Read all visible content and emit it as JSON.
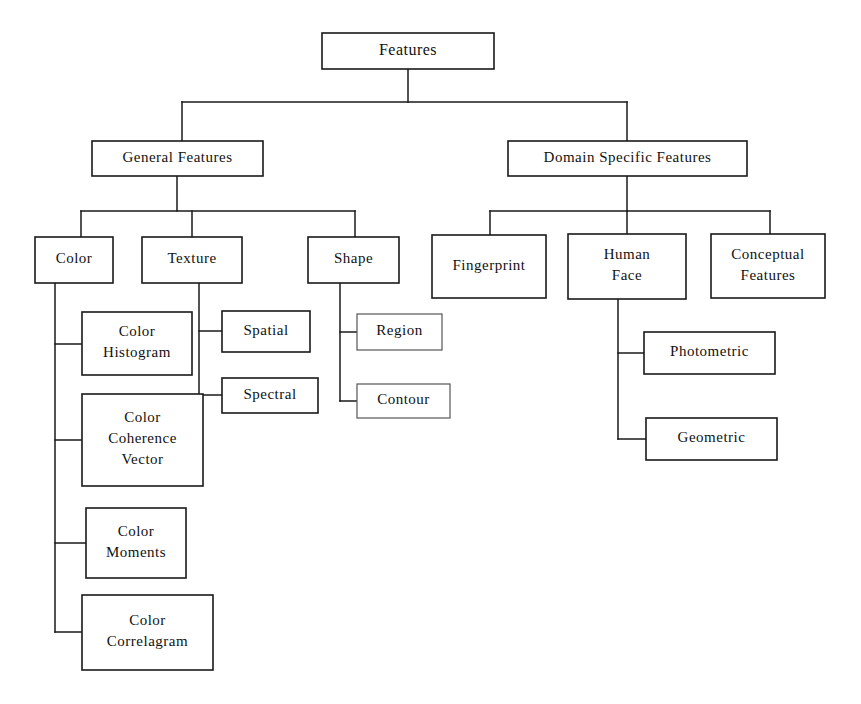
{
  "diagram": {
    "title": "Features",
    "type": "hierarchical-tree",
    "orientation": "top-down",
    "style": {
      "background": "#ffffff",
      "line_color": "#1a1a1a",
      "box_fill": "#ffffff",
      "text_color": "#111111"
    },
    "nodes": [
      {
        "id": "features",
        "label": "Features",
        "level": 0,
        "x": 322,
        "y": 33,
        "w": 172,
        "h": 36,
        "font_size": 16,
        "lines": [
          "Features"
        ],
        "faint": false
      },
      {
        "id": "general-features",
        "label": "General Features",
        "level": 1,
        "x": 92,
        "y": 141,
        "w": 171,
        "h": 35,
        "font_size": 15,
        "lines": [
          "General Features"
        ],
        "faint": false
      },
      {
        "id": "domain-specific-features",
        "label": "Domain Specific Features",
        "level": 1,
        "x": 508,
        "y": 141,
        "w": 239,
        "h": 35,
        "font_size": 15,
        "lines": [
          "Domain Specific Features"
        ],
        "faint": false
      },
      {
        "id": "color",
        "label": "Color",
        "level": 2,
        "x": 35,
        "y": 237,
        "w": 78,
        "h": 46,
        "font_size": 15,
        "lines": [
          "Color"
        ],
        "faint": false
      },
      {
        "id": "texture",
        "label": "Texture",
        "level": 2,
        "x": 142,
        "y": 237,
        "w": 100,
        "h": 46,
        "font_size": 15,
        "lines": [
          "Texture"
        ],
        "faint": false
      },
      {
        "id": "shape",
        "label": "Shape",
        "level": 2,
        "x": 308,
        "y": 237,
        "w": 91,
        "h": 46,
        "font_size": 15,
        "lines": [
          "Shape"
        ],
        "faint": false
      },
      {
        "id": "fingerprint",
        "label": "Fingerprint",
        "level": 2,
        "x": 432,
        "y": 235,
        "w": 114,
        "h": 63,
        "font_size": 15,
        "lines": [
          "Fingerprint"
        ],
        "faint": false
      },
      {
        "id": "human-face",
        "label": "Human Face",
        "level": 2,
        "x": 568,
        "y": 234,
        "w": 118,
        "h": 65,
        "font_size": 15,
        "lines": [
          "Human",
          "Face"
        ],
        "faint": false
      },
      {
        "id": "conceptual-features",
        "label": "Conceptual Features",
        "level": 2,
        "x": 711,
        "y": 234,
        "w": 114,
        "h": 64,
        "font_size": 15,
        "lines": [
          "Conceptual",
          "Features"
        ],
        "faint": false
      },
      {
        "id": "color-histogram",
        "label": "Color Histogram",
        "level": 3,
        "x": 82,
        "y": 312,
        "w": 110,
        "h": 63,
        "font_size": 15,
        "lines": [
          "Color",
          "Histogram"
        ],
        "faint": false
      },
      {
        "id": "color-coherence-vector",
        "label": "Color Coherence Vector",
        "level": 3,
        "x": 82,
        "y": 394,
        "w": 121,
        "h": 92,
        "font_size": 15,
        "lines": [
          "Color",
          "Coherence",
          "Vector"
        ],
        "faint": false
      },
      {
        "id": "color-moments",
        "label": "Color Moments",
        "level": 3,
        "x": 86,
        "y": 508,
        "w": 100,
        "h": 70,
        "font_size": 15,
        "lines": [
          "Color",
          "Moments"
        ],
        "faint": false
      },
      {
        "id": "color-correlagram",
        "label": "Color Correlagram",
        "level": 3,
        "x": 82,
        "y": 595,
        "w": 131,
        "h": 75,
        "font_size": 15,
        "lines": [
          "Color",
          "Correlagram"
        ],
        "faint": false
      },
      {
        "id": "spatial",
        "label": "Spatial",
        "level": 3,
        "x": 222,
        "y": 311,
        "w": 88,
        "h": 41,
        "font_size": 15,
        "lines": [
          "Spatial"
        ],
        "faint": false
      },
      {
        "id": "spectral",
        "label": "Spectral",
        "level": 3,
        "x": 222,
        "y": 378,
        "w": 96,
        "h": 35,
        "font_size": 15,
        "lines": [
          "Spectral"
        ],
        "faint": false
      },
      {
        "id": "region",
        "label": "Region",
        "level": 3,
        "x": 357,
        "y": 314,
        "w": 85,
        "h": 36,
        "font_size": 15,
        "lines": [
          "Region"
        ],
        "faint": true
      },
      {
        "id": "contour",
        "label": "Contour",
        "level": 3,
        "x": 357,
        "y": 384,
        "w": 93,
        "h": 34,
        "font_size": 15,
        "lines": [
          "Contour"
        ],
        "faint": true
      },
      {
        "id": "photometric",
        "label": "Photometric",
        "level": 3,
        "x": 644,
        "y": 332,
        "w": 131,
        "h": 42,
        "font_size": 15,
        "lines": [
          "Photometric"
        ],
        "faint": false
      },
      {
        "id": "geometric",
        "label": "Geometric",
        "level": 3,
        "x": 646,
        "y": 418,
        "w": 131,
        "h": 42,
        "font_size": 15,
        "lines": [
          "Geometric"
        ],
        "faint": false
      }
    ],
    "edges": [
      {
        "from": "features",
        "to": "general-features",
        "kind": "elbow-down"
      },
      {
        "from": "features",
        "to": "domain-specific-features",
        "kind": "elbow-down"
      },
      {
        "from": "general-features",
        "to": "color",
        "kind": "elbow-down"
      },
      {
        "from": "general-features",
        "to": "texture",
        "kind": "elbow-down"
      },
      {
        "from": "general-features",
        "to": "shape",
        "kind": "elbow-down"
      },
      {
        "from": "domain-specific-features",
        "to": "fingerprint",
        "kind": "elbow-down"
      },
      {
        "from": "domain-specific-features",
        "to": "human-face",
        "kind": "elbow-down"
      },
      {
        "from": "domain-specific-features",
        "to": "conceptual-features",
        "kind": "elbow-down"
      },
      {
        "from": "color",
        "to": "color-histogram",
        "kind": "elbow-side"
      },
      {
        "from": "color",
        "to": "color-coherence-vector",
        "kind": "elbow-side"
      },
      {
        "from": "color",
        "to": "color-moments",
        "kind": "elbow-side"
      },
      {
        "from": "color",
        "to": "color-correlagram",
        "kind": "elbow-side"
      },
      {
        "from": "texture",
        "to": "spatial",
        "kind": "elbow-side"
      },
      {
        "from": "texture",
        "to": "spectral",
        "kind": "elbow-side"
      },
      {
        "from": "shape",
        "to": "region",
        "kind": "elbow-side"
      },
      {
        "from": "shape",
        "to": "contour",
        "kind": "elbow-side"
      },
      {
        "from": "human-face",
        "to": "photometric",
        "kind": "elbow-side"
      },
      {
        "from": "human-face",
        "to": "geometric",
        "kind": "elbow-side"
      }
    ],
    "connector_paths": [
      {
        "name": "features-stem",
        "d": "M 408 69 L 408 102"
      },
      {
        "name": "features-bus",
        "d": "M 182 102 L 627 102"
      },
      {
        "name": "bus-to-general-features",
        "d": "M 182 102 L 182 141"
      },
      {
        "name": "bus-to-domain-features",
        "d": "M 627 102 L 627 141"
      },
      {
        "name": "general-features-stem",
        "d": "M 177 176 L 177 211"
      },
      {
        "name": "general-features-bus",
        "d": "M 81 211 L 355 211"
      },
      {
        "name": "bus-to-color",
        "d": "M 81 211 L 81 237"
      },
      {
        "name": "bus-to-texture",
        "d": "M 192 211 L 192 237"
      },
      {
        "name": "bus-to-shape",
        "d": "M 355 211 L 355 237"
      },
      {
        "name": "domain-features-stem",
        "d": "M 627 176 L 627 211"
      },
      {
        "name": "domain-features-bus",
        "d": "M 490 211 L 770 211"
      },
      {
        "name": "bus-to-fingerprint",
        "d": "M 490 211 L 490 235"
      },
      {
        "name": "bus-to-human-face",
        "d": "M 627 211 L 627 234"
      },
      {
        "name": "bus-to-conceptual",
        "d": "M 770 211 L 770 234"
      },
      {
        "name": "color-spine",
        "d": "M 55 283 L 55 632"
      },
      {
        "name": "color-to-histogram",
        "d": "M 55 344 L 82 344"
      },
      {
        "name": "color-to-coherence-vector",
        "d": "M 55 440 L 82 440"
      },
      {
        "name": "color-to-moments",
        "d": "M 55 543 L 86 543"
      },
      {
        "name": "color-to-correlagram",
        "d": "M 55 632 L 82 632"
      },
      {
        "name": "texture-spine",
        "d": "M 199 283 L 199 395"
      },
      {
        "name": "texture-to-spatial",
        "d": "M 199 331 L 222 331"
      },
      {
        "name": "texture-to-spectral",
        "d": "M 199 395 L 222 395"
      },
      {
        "name": "shape-spine",
        "d": "M 340 283 L 340 401"
      },
      {
        "name": "shape-to-region",
        "d": "M 340 332 L 357 332"
      },
      {
        "name": "shape-to-contour",
        "d": "M 340 401 L 357 401"
      },
      {
        "name": "human-face-spine",
        "d": "M 618 299 L 618 439"
      },
      {
        "name": "human-face-to-photometric",
        "d": "M 618 353 L 644 353"
      },
      {
        "name": "human-face-to-geometric",
        "d": "M 618 439 L 646 439"
      }
    ]
  }
}
